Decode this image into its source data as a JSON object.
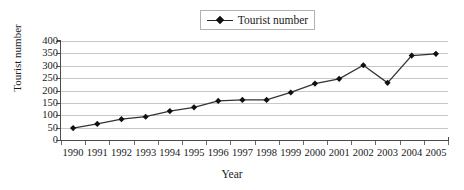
{
  "chart_data": {
    "type": "line",
    "title": "",
    "xlabel": "Year",
    "ylabel": "Tourist number",
    "categories": [
      "1990",
      "1991",
      "1992",
      "1993",
      "1994",
      "1995",
      "1996",
      "1997",
      "1998",
      "1999",
      "2000",
      "2001",
      "2002",
      "2003",
      "2004",
      "2005"
    ],
    "series": [
      {
        "name": "Tourist number",
        "values": [
          48,
          65,
          84,
          94,
          117,
          132,
          158,
          162,
          162,
          192,
          228,
          247,
          302,
          231,
          341,
          348
        ],
        "marker": "diamond",
        "color": "#333333"
      }
    ],
    "ylim": [
      0,
      400
    ],
    "yticks": [
      0,
      50,
      100,
      150,
      200,
      250,
      300,
      350,
      400
    ],
    "ytick_labels": [
      "0",
      "50",
      "100",
      "150",
      "200",
      "250",
      "300",
      "350",
      "400"
    ],
    "grid": true,
    "grid_axis": "y",
    "legend_position": "top-center",
    "legend_entries": [
      "Tourist number"
    ]
  },
  "legend": {
    "label": "Tourist number",
    "marker_icon": "diamond-marker-icon"
  },
  "axes": {
    "y_title": "Tourist number",
    "x_title": "Year"
  }
}
